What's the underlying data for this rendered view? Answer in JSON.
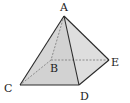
{
  "diagram": {
    "type": "square-pyramid",
    "colors": {
      "edge": "#2a2a2a",
      "hidden_edge": "#777777",
      "face_left": "#d6d6d6",
      "face_front": "#cfcfcf",
      "face_right": "#e2e2e2",
      "background": "#ffffff"
    },
    "vertices": {
      "A": {
        "label": "A",
        "x": 64,
        "y": 16,
        "label_x": 60,
        "label_y": 11
      },
      "B": {
        "label": "B",
        "x": 51,
        "y": 60,
        "label_x": 50,
        "label_y": 72
      },
      "C": {
        "label": "C",
        "x": 20,
        "y": 85,
        "label_x": 4,
        "label_y": 92
      },
      "D": {
        "label": "D",
        "x": 79,
        "y": 85,
        "label_x": 80,
        "label_y": 100
      },
      "E": {
        "label": "E",
        "x": 109,
        "y": 60,
        "label_x": 111,
        "label_y": 66
      }
    },
    "visible_edges": [
      [
        "A",
        "C"
      ],
      [
        "A",
        "D"
      ],
      [
        "A",
        "E"
      ],
      [
        "C",
        "D"
      ],
      [
        "D",
        "E"
      ]
    ],
    "hidden_edges": [
      [
        "A",
        "B"
      ],
      [
        "B",
        "C"
      ],
      [
        "B",
        "E"
      ]
    ]
  }
}
